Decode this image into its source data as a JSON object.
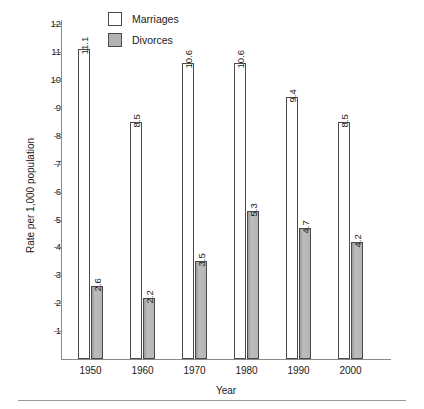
{
  "chart_data": {
    "type": "bar",
    "title": "",
    "xlabel": "Year",
    "ylabel": "Rate per 1,000 population",
    "categories": [
      "1950",
      "1960",
      "1970",
      "1980",
      "1990",
      "2000"
    ],
    "series": [
      {
        "name": "Marriages",
        "color": "#ffffff",
        "values": [
          11.1,
          8.5,
          10.6,
          10.6,
          9.4,
          8.5
        ]
      },
      {
        "name": "Divorces",
        "color": "#b3b3b3",
        "values": [
          2.6,
          2.2,
          3.5,
          5.3,
          4.7,
          4.2
        ]
      }
    ],
    "ylim": [
      0,
      12.4
    ],
    "yticks": [
      1,
      2,
      3,
      4,
      5,
      6,
      7,
      8,
      9,
      10,
      11,
      12
    ],
    "ytick_labels": [
      "1",
      "2",
      "3",
      "4",
      "5",
      "6",
      "7",
      "8",
      "9",
      "10",
      "11",
      "12"
    ],
    "grid": false,
    "legend_position": "top-center",
    "value_labels_rotated": true
  },
  "legend": {
    "items": [
      {
        "label": "Marriages",
        "swatch": "white-square-swatch"
      },
      {
        "label": "Divorces",
        "swatch": "gray-square-swatch"
      }
    ]
  },
  "axes": {
    "y_title": "Rate per 1,000 population",
    "x_title": "Year"
  }
}
